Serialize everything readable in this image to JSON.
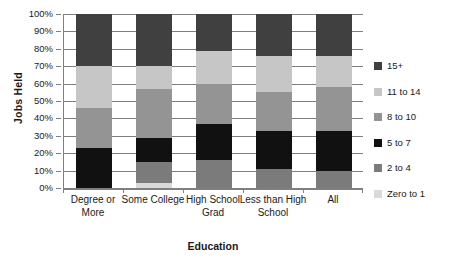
{
  "chart_data": {
    "type": "bar",
    "subtype": "stacked-percent",
    "title": "",
    "xlabel": "Education",
    "ylabel": "Jobs Held",
    "ylim": [
      0,
      100
    ],
    "ytick_labels": [
      "0%",
      "10%",
      "20%",
      "30%",
      "40%",
      "50%",
      "60%",
      "70%",
      "80%",
      "90%",
      "100%"
    ],
    "ytick_values": [
      0,
      10,
      20,
      30,
      40,
      50,
      60,
      70,
      80,
      90,
      100
    ],
    "grid": true,
    "legend_position": "right",
    "categories": [
      "Degree or More",
      "Some College",
      "High School Grad",
      "Less than High School",
      "All"
    ],
    "series": [
      {
        "name": "15+",
        "color": "#404040",
        "values": [
          30,
          30,
          21,
          24,
          24
        ]
      },
      {
        "name": "11 to 14",
        "color": "#c6c6c6",
        "values": [
          24,
          13,
          19,
          21,
          18
        ]
      },
      {
        "name": "8 to 10",
        "color": "#949494",
        "values": [
          23,
          28,
          23,
          22,
          25
        ]
      },
      {
        "name": "5 to 7",
        "color": "#111111",
        "values": [
          23,
          14,
          21,
          22,
          23
        ]
      },
      {
        "name": "2 to 4",
        "color": "#7b7b7b",
        "values": [
          0,
          12,
          16,
          11,
          10
        ]
      },
      {
        "name": "Zero to 1",
        "color": "#d9d9d9",
        "values": [
          0,
          3,
          0,
          0,
          0
        ]
      }
    ]
  },
  "legend": {
    "items": [
      {
        "label": "15+",
        "color": "#404040"
      },
      {
        "label": "11 to 14",
        "color": "#c6c6c6"
      },
      {
        "label": "8 to 10",
        "color": "#949494"
      },
      {
        "label": "5 to 7",
        "color": "#111111"
      },
      {
        "label": "2 to 4",
        "color": "#7b7b7b"
      },
      {
        "label": "Zero to 1",
        "color": "#d9d9d9"
      }
    ]
  },
  "axes": {
    "y_title": "Jobs Held",
    "x_title": "Education"
  }
}
